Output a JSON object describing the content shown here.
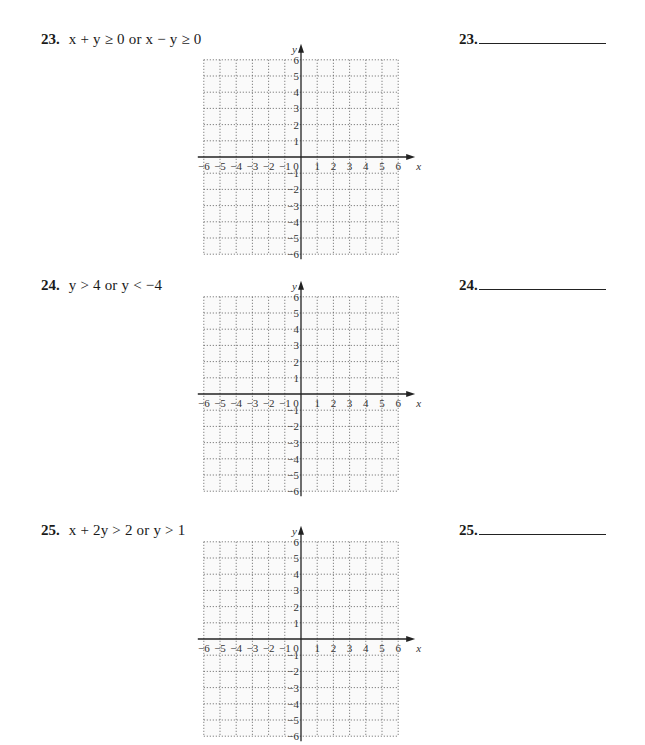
{
  "problems": [
    {
      "number": "23.",
      "expression": "x + y ≥ 0  or  x − y ≥ 0",
      "answer_label": "23.",
      "answer_value": ""
    },
    {
      "number": "24.",
      "expression": "y > 4  or  y < −4",
      "answer_label": "24.",
      "answer_value": ""
    },
    {
      "number": "25.",
      "expression": "x + 2y > 2  or  y > 1",
      "answer_label": "25.",
      "answer_value": ""
    }
  ],
  "grid": {
    "x_axis_label": "x",
    "y_axis_label": "y",
    "x_ticks": [
      "−6",
      "−5",
      "−4",
      "−3",
      "−2",
      "−1",
      "0",
      "1",
      "2",
      "3",
      "4",
      "5",
      "6"
    ],
    "y_ticks_pos": [
      "1",
      "2",
      "3",
      "4",
      "5",
      "6"
    ],
    "y_ticks_neg": [
      "−1",
      "−2",
      "−3",
      "−4",
      "−5",
      "−6"
    ],
    "range": [
      -6,
      6
    ]
  },
  "chart_data": [
    {
      "type": "scatter",
      "title": "23. x + y ≥ 0 or x − y ≥ 0 (blank coordinate grid)",
      "xlabel": "x",
      "ylabel": "y",
      "xlim": [
        -6,
        6
      ],
      "ylim": [
        -6,
        6
      ],
      "grid": true,
      "x_ticks": [
        -6,
        -5,
        -4,
        -3,
        -2,
        -1,
        0,
        1,
        2,
        3,
        4,
        5,
        6
      ],
      "y_ticks": [
        -6,
        -5,
        -4,
        -3,
        -2,
        -1,
        1,
        2,
        3,
        4,
        5,
        6
      ],
      "series": []
    },
    {
      "type": "scatter",
      "title": "24. y > 4 or y < −4 (blank coordinate grid)",
      "xlabel": "x",
      "ylabel": "y",
      "xlim": [
        -6,
        6
      ],
      "ylim": [
        -6,
        6
      ],
      "grid": true,
      "x_ticks": [
        -6,
        -5,
        -4,
        -3,
        -2,
        -1,
        0,
        1,
        2,
        3,
        4,
        5,
        6
      ],
      "y_ticks": [
        -6,
        -5,
        -4,
        -3,
        -2,
        -1,
        1,
        2,
        3,
        4,
        5,
        6
      ],
      "series": []
    },
    {
      "type": "scatter",
      "title": "25. x + 2y > 2 or y > 1 (blank coordinate grid)",
      "xlabel": "x",
      "ylabel": "y",
      "xlim": [
        -6,
        6
      ],
      "ylim": [
        -6,
        6
      ],
      "grid": true,
      "x_ticks": [
        -6,
        -5,
        -4,
        -3,
        -2,
        -1,
        0,
        1,
        2,
        3,
        4,
        5,
        6
      ],
      "y_ticks": [
        -6,
        -5,
        -4,
        -3,
        -2,
        -1,
        1,
        2,
        3,
        4,
        5,
        6
      ],
      "series": []
    }
  ]
}
